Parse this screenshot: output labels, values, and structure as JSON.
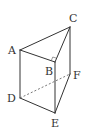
{
  "diagram": {
    "type": "triangular-prism",
    "colors": {
      "edge": "#333333",
      "hidden_edge": "#555555",
      "label": "#333333",
      "background": "#ffffff"
    },
    "vertices": {
      "A": {
        "label": "A",
        "x": 20,
        "y": 50,
        "label_x": 8,
        "label_y": 54
      },
      "B": {
        "label": "B",
        "x": 55,
        "y": 62,
        "label_x": 45,
        "label_y": 75
      },
      "C": {
        "label": "C",
        "x": 70,
        "y": 27,
        "label_x": 69,
        "label_y": 22
      },
      "D": {
        "label": "D",
        "x": 20,
        "y": 98,
        "label_x": 7,
        "label_y": 102
      },
      "E": {
        "label": "E",
        "x": 55,
        "y": 113,
        "label_x": 51,
        "label_y": 127
      },
      "F": {
        "label": "F",
        "x": 70,
        "y": 74,
        "label_x": 73,
        "label_y": 79
      }
    },
    "edges_visible": [
      "AC",
      "AB",
      "BC",
      "AD",
      "BE",
      "CF",
      "DE",
      "EF"
    ],
    "edges_hidden": [
      "DF"
    ],
    "right_angle_at": "B"
  }
}
